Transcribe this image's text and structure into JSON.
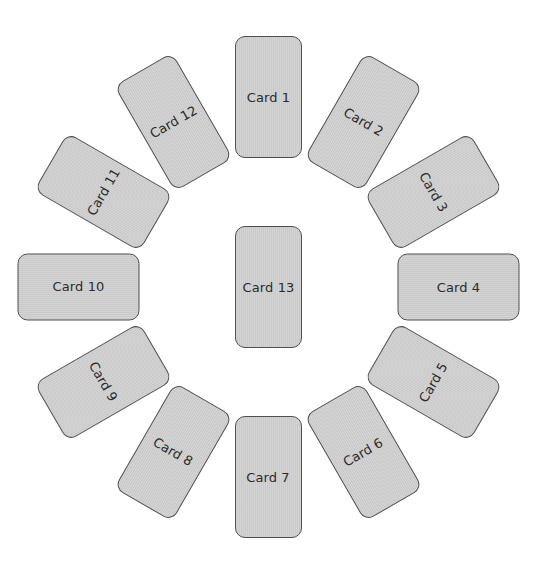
{
  "diagram": {
    "type": "circular-card-layout",
    "center": {
      "x": 268.5,
      "y": 287
    },
    "radius": 190,
    "colors": {
      "card_fill": "#d0d0d0",
      "card_border": "#4f4f4f",
      "text": "#2a2a2a",
      "background": "#ffffff"
    },
    "ring_cards": [
      {
        "label": "Card 1",
        "angle": 0,
        "text_rotation": 0
      },
      {
        "label": "Card 2",
        "angle": 30,
        "text_rotation": 30
      },
      {
        "label": "Card 3",
        "angle": 60,
        "text_rotation": 60
      },
      {
        "label": "Card 4",
        "angle": 90,
        "text_rotation": 0
      },
      {
        "label": "Card 5",
        "angle": 120,
        "text_rotation": -60
      },
      {
        "label": "Card 6",
        "angle": 150,
        "text_rotation": -30
      },
      {
        "label": "Card 7",
        "angle": 180,
        "text_rotation": 0
      },
      {
        "label": "Card 8",
        "angle": 210,
        "text_rotation": 30
      },
      {
        "label": "Card 9",
        "angle": 240,
        "text_rotation": 60
      },
      {
        "label": "Card 10",
        "angle": 270,
        "text_rotation": 0
      },
      {
        "label": "Card 11",
        "angle": 300,
        "text_rotation": -60
      },
      {
        "label": "Card 12",
        "angle": 330,
        "text_rotation": -30
      }
    ],
    "center_card": {
      "label": "Card 13",
      "angle": 0,
      "text_rotation": 0
    }
  }
}
